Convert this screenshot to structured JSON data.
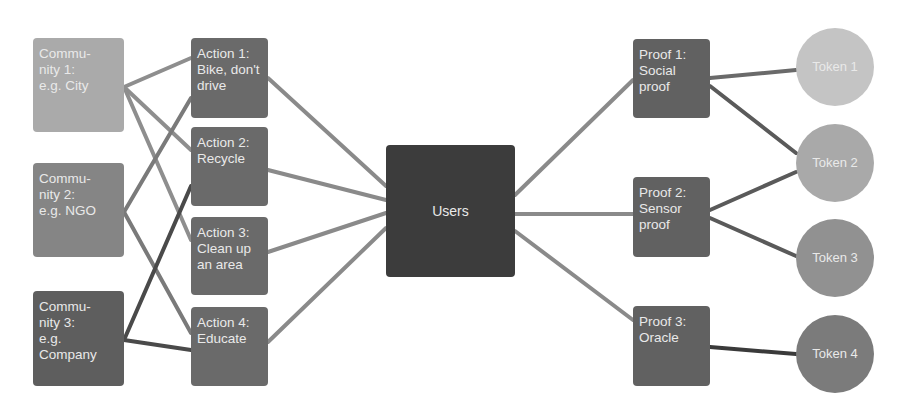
{
  "diagram": {
    "communities": [
      {
        "id": "c1",
        "lines": [
          "Commu-",
          "nity 1:",
          "e.g. City"
        ],
        "x": 33,
        "y": 38,
        "w": 91,
        "h": 94,
        "color": "#aaaaaa"
      },
      {
        "id": "c2",
        "lines": [
          "Commu-",
          "nity 2:",
          "e.g. NGO"
        ],
        "x": 33,
        "y": 163,
        "w": 91,
        "h": 94,
        "color": "#858585"
      },
      {
        "id": "c3",
        "lines": [
          "Commu-",
          "nity 3:",
          "e.g.",
          "Company"
        ],
        "x": 33,
        "y": 291,
        "w": 91,
        "h": 95,
        "color": "#5e5e5e"
      }
    ],
    "actions": [
      {
        "id": "a1",
        "lines": [
          "Action 1:",
          "Bike, don't",
          "drive"
        ],
        "x": 191,
        "y": 38,
        "w": 77,
        "h": 80,
        "color": "#6a6a6a"
      },
      {
        "id": "a2",
        "lines": [
          "Action 2:",
          "Recycle"
        ],
        "x": 191,
        "y": 127,
        "w": 77,
        "h": 79,
        "color": "#6a6a6a"
      },
      {
        "id": "a3",
        "lines": [
          "Action 3:",
          "Clean up",
          "an area"
        ],
        "x": 191,
        "y": 217,
        "w": 77,
        "h": 78,
        "color": "#6a6a6a"
      },
      {
        "id": "a4",
        "lines": [
          "Action 4:",
          "Educate"
        ],
        "x": 191,
        "y": 307,
        "w": 77,
        "h": 79,
        "color": "#6a6a6a"
      }
    ],
    "users": {
      "id": "u",
      "label": "Users",
      "x": 386,
      "y": 145,
      "w": 129,
      "h": 132,
      "color": "#3c3c3c"
    },
    "proofs": [
      {
        "id": "p1",
        "lines": [
          "Proof 1:",
          "Social",
          "proof"
        ],
        "x": 633,
        "y": 39,
        "w": 77,
        "h": 79,
        "color": "#616161"
      },
      {
        "id": "p2",
        "lines": [
          "Proof 2:",
          "Sensor",
          "proof"
        ],
        "x": 633,
        "y": 177,
        "w": 77,
        "h": 80,
        "color": "#616161"
      },
      {
        "id": "p3",
        "lines": [
          "Proof 3:",
          "Oracle"
        ],
        "x": 633,
        "y": 306,
        "w": 77,
        "h": 80,
        "color": "#616161"
      }
    ],
    "tokens": [
      {
        "id": "t1",
        "label": "Token 1",
        "cx": 835,
        "cy": 67,
        "r": 39,
        "color": "#c4c4c4"
      },
      {
        "id": "t2",
        "label": "Token 2",
        "cx": 835,
        "cy": 163,
        "r": 39,
        "color": "#a9a9a9"
      },
      {
        "id": "t3",
        "label": "Token 3",
        "cx": 835,
        "cy": 258,
        "r": 39,
        "color": "#919191"
      },
      {
        "id": "t4",
        "label": "Token 4",
        "cx": 835,
        "cy": 354,
        "r": 39,
        "color": "#7b7b7b"
      }
    ],
    "edges": [
      {
        "from": "c1",
        "to": "a1",
        "color": "#8e8e8e"
      },
      {
        "from": "c1",
        "to": "a2",
        "color": "#8e8e8e"
      },
      {
        "from": "c1",
        "to": "a3",
        "color": "#8e8e8e"
      },
      {
        "from": "c2",
        "to": "a1",
        "color": "#7a7a7a"
      },
      {
        "from": "c2",
        "to": "a4",
        "color": "#7a7a7a"
      },
      {
        "from": "c3",
        "to": "a2",
        "color": "#4a4a4a"
      },
      {
        "from": "c3",
        "to": "a4",
        "color": "#4a4a4a"
      },
      {
        "from": "a1",
        "to": "u",
        "color": "#8a8a8a"
      },
      {
        "from": "a2",
        "to": "u",
        "color": "#8a8a8a"
      },
      {
        "from": "a3",
        "to": "u",
        "color": "#8a8a8a"
      },
      {
        "from": "a4",
        "to": "u",
        "color": "#8a8a8a"
      },
      {
        "from": "u",
        "to": "p1",
        "color": "#8a8a8a"
      },
      {
        "from": "u",
        "to": "p2",
        "color": "#8a8a8a"
      },
      {
        "from": "u",
        "to": "p3",
        "color": "#8a8a8a"
      },
      {
        "from": "p1",
        "to": "t1",
        "color": "#6a6a6a"
      },
      {
        "from": "p1",
        "to": "t2",
        "color": "#5a5a5a"
      },
      {
        "from": "p2",
        "to": "t2",
        "color": "#5a5a5a"
      },
      {
        "from": "p2",
        "to": "t3",
        "color": "#5a5a5a"
      },
      {
        "from": "p3",
        "to": "t4",
        "color": "#3a3a3a"
      }
    ],
    "anchors": {
      "c1": {
        "out": [
          124,
          87
        ]
      },
      "c2": {
        "out": [
          124,
          212
        ]
      },
      "c3": {
        "out": [
          124,
          340
        ]
      },
      "a1": {
        "in": [
          191,
          58
        ],
        "out": [
          268,
          78
        ]
      },
      "a2": {
        "in": [
          191,
          177
        ],
        "out": [
          268,
          170
        ]
      },
      "a3": {
        "in": [
          191,
          246
        ],
        "out": [
          268,
          252
        ]
      },
      "a4": {
        "in": [
          191,
          346
        ],
        "out": [
          268,
          342
        ]
      },
      "u": {
        "in": [
          386,
          205
        ],
        "out": [
          515,
          212
        ]
      },
      "p1": {
        "in": [
          633,
          80
        ],
        "out": [
          710,
          77
        ]
      },
      "p2": {
        "in": [
          633,
          214
        ],
        "out": [
          710,
          214
        ]
      },
      "p3": {
        "in": [
          633,
          320
        ],
        "out": [
          710,
          347
        ]
      },
      "t1": {
        "in": [
          796,
          70
        ]
      },
      "t2": {
        "in": [
          796,
          163
        ]
      },
      "t3": {
        "in": [
          796,
          258
        ]
      },
      "t4": {
        "in": [
          796,
          354
        ]
      }
    }
  }
}
